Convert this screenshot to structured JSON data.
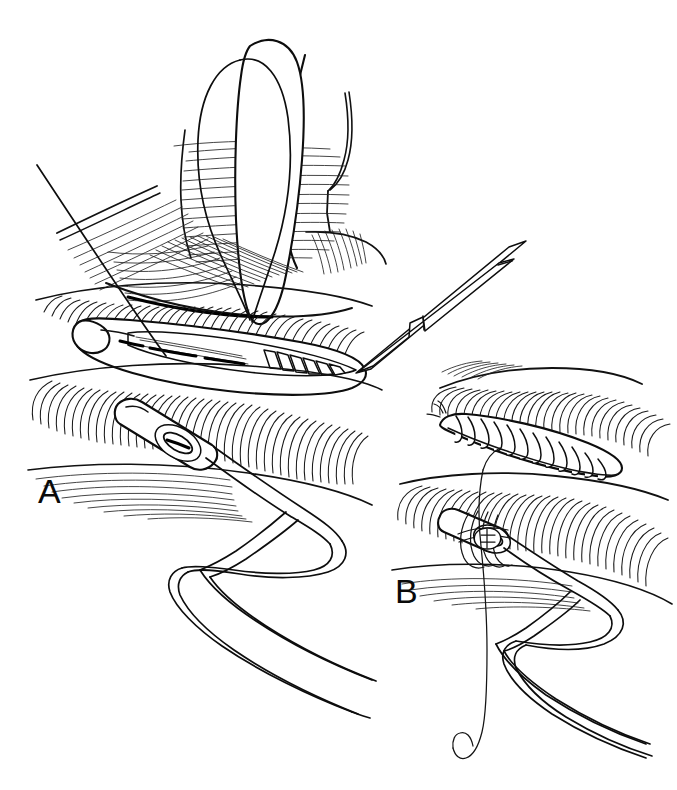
{
  "figure": {
    "background_color": "#ffffff",
    "ink_color": "#0d0d0d",
    "width": 677,
    "height": 790
  },
  "panels": [
    {
      "id": "panel-a",
      "label": "A",
      "label_x": 38,
      "label_y": 503,
      "caption": "Drain exit site with tissue retracted; suture passed through wound edges alongside tube",
      "elements": [
        {
          "name": "suture-needle-thread",
          "kind": "thread"
        },
        {
          "name": "retractor-blade",
          "kind": "instrument"
        },
        {
          "name": "forceps-shank",
          "kind": "instrument"
        },
        {
          "name": "forceps-ratchet-notch",
          "kind": "instrument-detail"
        },
        {
          "name": "hemostat-serrated-jaw",
          "kind": "instrument"
        },
        {
          "name": "drain-tube",
          "kind": "drain"
        },
        {
          "name": "tissue-hatching-upper",
          "kind": "tissue"
        },
        {
          "name": "tissue-hatching-lower",
          "kind": "tissue"
        }
      ]
    },
    {
      "id": "panel-b",
      "label": "B",
      "label_x": 395,
      "label_y": 603,
      "caption": "Wound closed with running suture; suture knotted around the drain tube",
      "elements": [
        {
          "name": "closed-incision-suture-line",
          "kind": "suture-line"
        },
        {
          "name": "suture-knot-on-drain",
          "kind": "knot"
        },
        {
          "name": "suture-tail",
          "kind": "thread"
        },
        {
          "name": "drain-tube",
          "kind": "drain"
        },
        {
          "name": "tissue-hatching-upper",
          "kind": "tissue"
        },
        {
          "name": "tissue-hatching-lower",
          "kind": "tissue"
        }
      ]
    }
  ]
}
